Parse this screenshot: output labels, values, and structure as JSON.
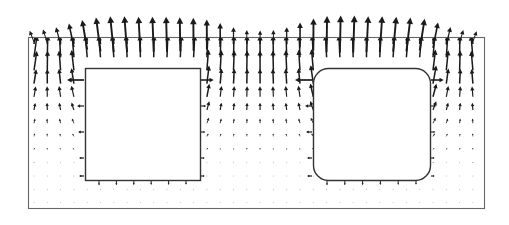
{
  "figure": {
    "title": "",
    "caption": "",
    "background_color": "#ffffff",
    "vector_color": "#1a1a1a",
    "boundary_color": "#555555",
    "obstacle_color": "#333333"
  },
  "chart_data": {
    "type": "quiver",
    "title": "",
    "subtitle": "",
    "xlabel": "",
    "ylabel": "",
    "xlim": [
      0,
      456
    ],
    "ylim": [
      0,
      171
    ],
    "grid": false,
    "legend": null,
    "annotations": [],
    "domain_box": {
      "label": "outer-domain",
      "x": 28,
      "y": 37,
      "width": 456,
      "height": 171,
      "corner_radius": 0,
      "stroke": "#666666",
      "stroke_width": 1.1
    },
    "obstacles": [
      {
        "label": "left-block",
        "x": 85,
        "y": 68,
        "width": 115,
        "height": 112,
        "corner_radius": 0,
        "stroke": "#333333",
        "stroke_width": 1.4
      },
      {
        "label": "right-block",
        "x": 313,
        "y": 68,
        "width": 117,
        "height": 112,
        "corner_radius": 15,
        "stroke": "#333333",
        "stroke_width": 1.4
      }
    ],
    "grid_spec": {
      "x_start": 34,
      "x_step": 13.3,
      "x_count": 34,
      "y_start": 44,
      "y_step": 13.2,
      "y_count": 13
    },
    "boundary_jets": {
      "note": "Upward arrows crossing the top boundary line; length peaks above each obstacle and dips over the central gap and near the side walls.",
      "y_base": 37,
      "x_start": 34,
      "x_step": 13.3,
      "count": 34,
      "lengths": [
        12,
        14,
        18,
        24,
        30,
        34,
        36,
        36,
        35,
        35,
        35,
        34,
        33,
        30,
        24,
        17,
        12,
        11,
        12,
        17,
        25,
        32,
        36,
        37,
        37,
        36,
        36,
        35,
        34,
        32,
        26,
        18,
        13,
        11
      ]
    },
    "field_note": "Source-like divergence: vectors point outward and upward, strong near the top boundary and above the obstacles, nearly zero along the lower third of the domain.",
    "magnitude_scale": {
      "max_arrow_px": 22,
      "min_arrow_px": 1.5
    }
  }
}
